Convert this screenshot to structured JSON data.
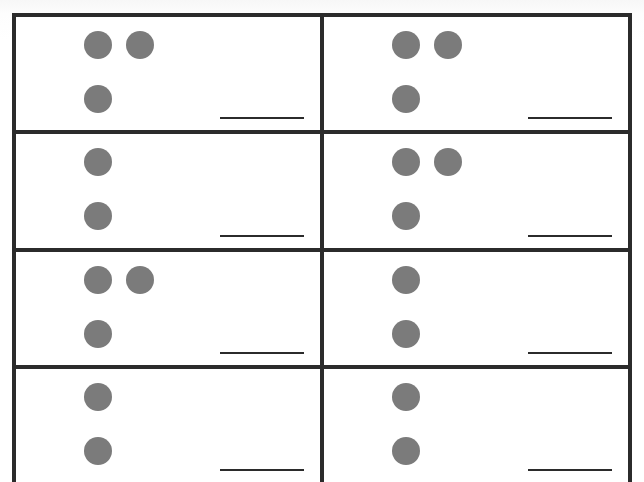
{
  "document": {
    "kind": "counting-dots-worksheet",
    "title": "Counting Dots Worksheet",
    "grid": {
      "rows": 4,
      "columns": 2
    },
    "ink_color": "#2b2b2b",
    "dot_color": "#7b7b7b",
    "paper_color": "#ffffff"
  },
  "problems": [
    {
      "id": "problem-1",
      "row": 1,
      "column": 1,
      "dot_count": 3,
      "dot_rows": [
        2,
        1
      ],
      "answer_value": "",
      "answer_placeholder": ""
    },
    {
      "id": "problem-2",
      "row": 1,
      "column": 2,
      "dot_count": 3,
      "dot_rows": [
        2,
        1
      ],
      "answer_value": "",
      "answer_placeholder": ""
    },
    {
      "id": "problem-3",
      "row": 2,
      "column": 1,
      "dot_count": 2,
      "dot_rows": [
        1,
        1
      ],
      "answer_value": "",
      "answer_placeholder": ""
    },
    {
      "id": "problem-4",
      "row": 2,
      "column": 2,
      "dot_count": 3,
      "dot_rows": [
        2,
        1
      ],
      "answer_value": "",
      "answer_placeholder": ""
    },
    {
      "id": "problem-5",
      "row": 3,
      "column": 1,
      "dot_count": 3,
      "dot_rows": [
        2,
        1
      ],
      "answer_value": "",
      "answer_placeholder": ""
    },
    {
      "id": "problem-6",
      "row": 3,
      "column": 2,
      "dot_count": 2,
      "dot_rows": [
        1,
        1
      ],
      "answer_value": "",
      "answer_placeholder": ""
    },
    {
      "id": "problem-7",
      "row": 4,
      "column": 1,
      "dot_count": 2,
      "dot_rows": [
        1,
        1
      ],
      "answer_value": "",
      "answer_placeholder": ""
    },
    {
      "id": "problem-8",
      "row": 4,
      "column": 2,
      "dot_count": 2,
      "dot_rows": [
        1,
        1
      ],
      "answer_value": "",
      "answer_placeholder": ""
    }
  ]
}
